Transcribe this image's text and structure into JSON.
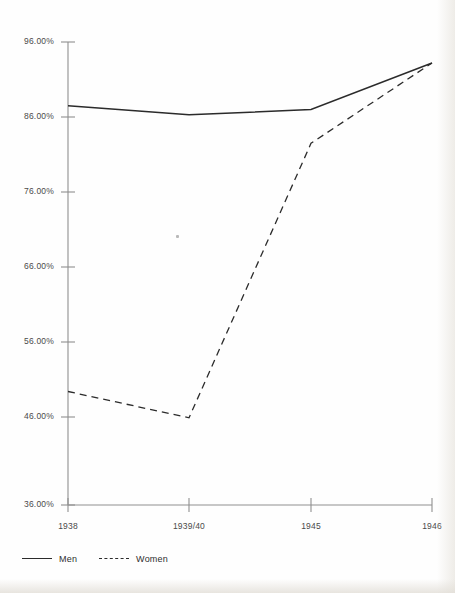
{
  "chart_data": {
    "type": "line",
    "title": "",
    "subtitle": "",
    "xlabel": "",
    "ylabel": "",
    "categories": [
      "1938",
      "1939/40",
      "1945",
      "1946"
    ],
    "series": [
      {
        "name": "Men",
        "style": "solid",
        "values": [
          87.5,
          86.3,
          87.0,
          93.2
        ]
      },
      {
        "name": "Women",
        "style": "dashed",
        "values": [
          49.4,
          45.9,
          82.5,
          93.2
        ]
      }
    ],
    "ylim": [
      36.0,
      96.0
    ],
    "ytick_values": [
      96.0,
      86.0,
      76.0,
      66.0,
      56.0,
      46.0,
      36.0
    ],
    "ytick_labels": [
      "96.00%",
      "86.00%",
      "76.00%",
      "66.00%",
      "56.00%",
      "46.00%",
      "36.00%"
    ],
    "xtick_labels": [
      "1938",
      "1939/40",
      "1945",
      "1946"
    ],
    "grid": false,
    "legend_position": "bottom-left",
    "legend_entries": [
      {
        "label": "Men",
        "style": "solid"
      },
      {
        "label": "Women",
        "style": "dashed"
      }
    ],
    "axis_color": "#8a8a8a",
    "line_color": "#2b2b2b"
  }
}
